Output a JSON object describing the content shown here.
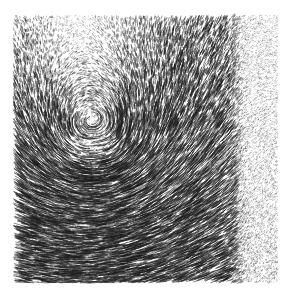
{
  "figure": {
    "title": "",
    "background_color": "#ffffff",
    "stroke_color": "#1a1a1a",
    "width_px": 292,
    "height_px": 301
  },
  "plot_area": {
    "left_px": 13,
    "top_px": 15,
    "right_px": 278,
    "bottom_px": 283,
    "width_px": 265,
    "height_px": 268,
    "frame_visible": false,
    "axes_visible": false,
    "tick_labels_visible": false
  },
  "chart_data": {
    "type": "scatter",
    "render_style": "vector-field-hedgehog-lic",
    "title": "",
    "subtitle": "",
    "xlabel": "",
    "ylabel": "",
    "legend": [],
    "legend_position": "none",
    "grid": false,
    "colorbar": false,
    "xlim": [
      0,
      1
    ],
    "ylim": [
      0,
      1
    ],
    "x": [],
    "y": [],
    "values": [],
    "glyph": {
      "shape": "line-segment",
      "count": 19000,
      "max_length_px": 9.0,
      "min_length_px": 0.6,
      "line_width_px": 0.62,
      "color": "#1a1a1a",
      "opacity": 0.85
    },
    "vortex": {
      "center_x_px": 95,
      "center_y_px": 146,
      "rotation": "clockwise",
      "core_radius_px": 30,
      "core_is_low_magnitude": true,
      "strength": 1.0
    },
    "background_flow": {
      "direction_degrees": -8,
      "magnitude": 0.72
    },
    "magnitude_falloff": {
      "axis": "x",
      "cutoff_px": 232,
      "transition_width_px": 14,
      "value_left": 1.0,
      "value_right": 0.07,
      "note": "Sharp drop in vector magnitude near right boundary producing a stippled/dotted band."
    },
    "regions": [
      {
        "name": "upper-left-shear",
        "x_range_px": [
          13,
          140
        ],
        "y_range_px": [
          15,
          110
        ],
        "mean_angle_degrees": -22,
        "mean_magnitude": 0.88,
        "density": "high"
      },
      {
        "name": "upper-right-stream",
        "x_range_px": [
          140,
          232
        ],
        "y_range_px": [
          15,
          110
        ],
        "mean_angle_degrees": -6,
        "mean_magnitude": 0.8,
        "density": "high"
      },
      {
        "name": "vortex-eye",
        "x_range_px": [
          60,
          135
        ],
        "y_range_px": [
          112,
          182
        ],
        "mean_angle_degrees": 0,
        "mean_magnitude": 0.12,
        "density": "low"
      },
      {
        "name": "lower-left-horizontal",
        "x_range_px": [
          13,
          120
        ],
        "y_range_px": [
          190,
          283
        ],
        "mean_angle_degrees": -4,
        "mean_magnitude": 0.84,
        "density": "high"
      },
      {
        "name": "lower-right-stream",
        "x_range_px": [
          120,
          232
        ],
        "y_range_px": [
          190,
          283
        ],
        "mean_angle_degrees": -10,
        "mean_magnitude": 0.86,
        "density": "high"
      },
      {
        "name": "right-stipple-band",
        "x_range_px": [
          232,
          278
        ],
        "y_range_px": [
          15,
          283
        ],
        "mean_angle_degrees": -8,
        "mean_magnitude": 0.06,
        "density": "sparse-dots"
      }
    ]
  }
}
